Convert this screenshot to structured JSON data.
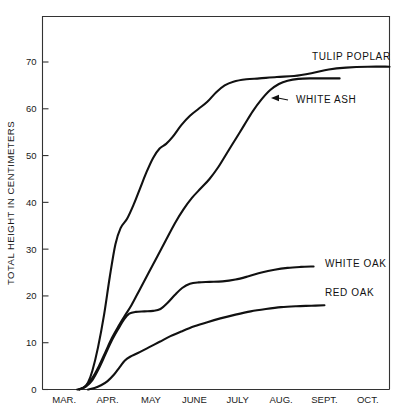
{
  "chart_data": {
    "type": "line",
    "title": "",
    "xlabel": "",
    "ylabel": "TOTAL HEIGHT IN CENTIMETERS",
    "ylim": [
      0,
      78
    ],
    "yticks": [
      0,
      10,
      20,
      30,
      40,
      50,
      60,
      70
    ],
    "ytick_labels": [
      "0",
      "10",
      "20",
      "30",
      "40",
      "50",
      "60",
      "70"
    ],
    "categories": [
      "MAR.",
      "APR.",
      "MAY",
      "JUNE",
      "JULY",
      "AUG.",
      "SEPT.",
      "OCT."
    ],
    "grid": false,
    "legend_position": "inline-right-labels",
    "x_units": "months, Mar through Oct",
    "series": [
      {
        "name": "TULIP POPLAR",
        "label": "TULIP POPLAR",
        "label_x": 312,
        "label_y": 60,
        "leader": false,
        "points": [
          [
            0.8,
            0.0
          ],
          [
            0.95,
            0.4
          ],
          [
            1.05,
            1.5
          ],
          [
            1.15,
            4.0
          ],
          [
            1.28,
            9.0
          ],
          [
            1.42,
            16.0
          ],
          [
            1.55,
            24.0
          ],
          [
            1.68,
            31.0
          ],
          [
            1.8,
            34.5
          ],
          [
            1.95,
            36.5
          ],
          [
            2.1,
            39.5
          ],
          [
            2.25,
            43.0
          ],
          [
            2.4,
            46.5
          ],
          [
            2.55,
            49.5
          ],
          [
            2.7,
            51.5
          ],
          [
            2.85,
            52.5
          ],
          [
            3.0,
            54.0
          ],
          [
            3.2,
            56.5
          ],
          [
            3.4,
            58.5
          ],
          [
            3.6,
            60.0
          ],
          [
            3.8,
            61.5
          ],
          [
            4.0,
            63.5
          ],
          [
            4.2,
            65.0
          ],
          [
            4.4,
            65.8
          ],
          [
            4.7,
            66.3
          ],
          [
            5.0,
            66.5
          ],
          [
            5.4,
            66.8
          ],
          [
            5.8,
            67.0
          ],
          [
            6.2,
            67.6
          ],
          [
            6.6,
            68.4
          ],
          [
            7.0,
            68.8
          ],
          [
            7.5,
            69.0
          ],
          [
            8.0,
            69.0
          ]
        ],
        "final_value": 69.0
      },
      {
        "name": "WHITE ASH",
        "label": "WHITE ASH",
        "label_x": 296,
        "label_y": 103,
        "leader": true,
        "leader_from_x": 288,
        "leader_from_y": 100,
        "leader_to_x": 271,
        "leader_to_y": 98,
        "points": [
          [
            0.85,
            0.0
          ],
          [
            1.0,
            0.8
          ],
          [
            1.15,
            2.5
          ],
          [
            1.3,
            5.0
          ],
          [
            1.45,
            8.0
          ],
          [
            1.6,
            11.0
          ],
          [
            1.75,
            13.5
          ],
          [
            1.9,
            15.8
          ],
          [
            2.05,
            18.0
          ],
          [
            2.25,
            21.5
          ],
          [
            2.45,
            25.0
          ],
          [
            2.65,
            28.5
          ],
          [
            2.85,
            32.0
          ],
          [
            3.05,
            35.5
          ],
          [
            3.25,
            38.5
          ],
          [
            3.45,
            41.0
          ],
          [
            3.65,
            43.0
          ],
          [
            3.85,
            45.0
          ],
          [
            4.05,
            47.5
          ],
          [
            4.25,
            50.5
          ],
          [
            4.45,
            53.5
          ],
          [
            4.65,
            56.5
          ],
          [
            4.85,
            59.5
          ],
          [
            5.05,
            62.0
          ],
          [
            5.25,
            64.0
          ],
          [
            5.45,
            65.3
          ],
          [
            5.65,
            66.0
          ],
          [
            5.9,
            66.4
          ],
          [
            6.2,
            66.5
          ],
          [
            6.6,
            66.5
          ],
          [
            6.85,
            66.5
          ]
        ],
        "final_value": 66.5
      },
      {
        "name": "WHITE OAK",
        "label": "WHITE OAK",
        "label_x": 325,
        "label_y": 267,
        "leader": false,
        "points": [
          [
            0.85,
            0.0
          ],
          [
            1.0,
            0.6
          ],
          [
            1.15,
            2.0
          ],
          [
            1.3,
            4.5
          ],
          [
            1.45,
            7.5
          ],
          [
            1.6,
            10.5
          ],
          [
            1.75,
            13.0
          ],
          [
            1.88,
            15.0
          ],
          [
            2.0,
            16.2
          ],
          [
            2.15,
            16.6
          ],
          [
            2.35,
            16.7
          ],
          [
            2.55,
            16.8
          ],
          [
            2.72,
            17.2
          ],
          [
            2.88,
            18.5
          ],
          [
            3.05,
            20.2
          ],
          [
            3.22,
            21.7
          ],
          [
            3.4,
            22.6
          ],
          [
            3.6,
            22.9
          ],
          [
            3.85,
            23.0
          ],
          [
            4.15,
            23.1
          ],
          [
            4.45,
            23.5
          ],
          [
            4.75,
            24.2
          ],
          [
            5.05,
            25.0
          ],
          [
            5.35,
            25.6
          ],
          [
            5.65,
            26.0
          ],
          [
            5.95,
            26.2
          ],
          [
            6.25,
            26.3
          ]
        ],
        "final_value": 26.3
      },
      {
        "name": "RED OAK",
        "label": "RED OAK",
        "label_x": 325,
        "label_y": 296,
        "leader": false,
        "points": [
          [
            1.05,
            0.0
          ],
          [
            1.2,
            0.3
          ],
          [
            1.35,
            0.9
          ],
          [
            1.5,
            1.8
          ],
          [
            1.65,
            3.2
          ],
          [
            1.78,
            4.8
          ],
          [
            1.9,
            6.2
          ],
          [
            2.02,
            7.0
          ],
          [
            2.2,
            7.8
          ],
          [
            2.45,
            9.0
          ],
          [
            2.7,
            10.2
          ],
          [
            2.95,
            11.4
          ],
          [
            3.2,
            12.4
          ],
          [
            3.5,
            13.5
          ],
          [
            3.8,
            14.4
          ],
          [
            4.1,
            15.2
          ],
          [
            4.45,
            16.0
          ],
          [
            4.8,
            16.7
          ],
          [
            5.15,
            17.2
          ],
          [
            5.5,
            17.6
          ],
          [
            5.85,
            17.8
          ],
          [
            6.2,
            17.9
          ],
          [
            6.5,
            18.0
          ]
        ],
        "final_value": 18.0
      }
    ]
  },
  "axes": {
    "y_axis_title": "TOTAL HEIGHT IN CENTIMETERS",
    "y_tick_values": [
      "70",
      "60",
      "50",
      "40",
      "30",
      "20",
      "10",
      "0"
    ],
    "x_tick_values": [
      "MAR.",
      "APR.",
      "MAY",
      "JUNE",
      "JULY",
      "AUG.",
      "SEPT.",
      "OCT."
    ]
  },
  "labels": {
    "tulip_poplar": "TULIP POPLAR",
    "white_ash": "WHITE ASH",
    "white_oak": "WHITE OAK",
    "red_oak": "RED OAK"
  },
  "colors": {
    "background": "#ffffff",
    "line": "#111111",
    "axis": "#333333",
    "text": "#1a1a1a"
  }
}
